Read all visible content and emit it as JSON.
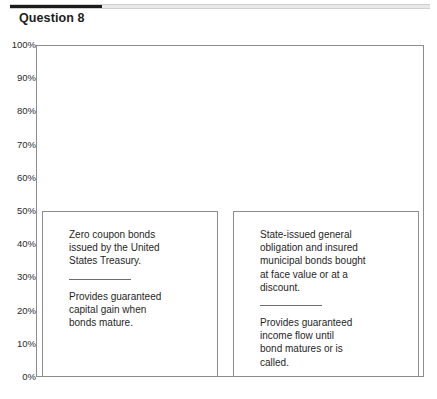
{
  "header": {
    "progress_percent": 22,
    "question_label": "Question 8"
  },
  "chart_data": {
    "type": "bar",
    "title": "",
    "xlabel": "",
    "ylabel": "",
    "ylim": [
      0,
      100
    ],
    "grid": false,
    "legend": null,
    "categories": [
      "",
      ""
    ],
    "values": [
      50,
      50
    ],
    "y_tick_labels": [
      "100%",
      "90%",
      "80%",
      "70%",
      "60%",
      "50%",
      "40%",
      "30%",
      "20%",
      "10%",
      "0%"
    ],
    "y_ticks": [
      100,
      90,
      80,
      70,
      60,
      50,
      40,
      30,
      20,
      10,
      0
    ],
    "bars": [
      {
        "value": 50,
        "primary_text": "Zero coupon bonds\nissued by the United\nStates Treasury.",
        "secondary_text": "Provides guaranteed\ncapital gain when\nbonds mature."
      },
      {
        "value": 50,
        "primary_text": "State-issued general\nobligation and insured\nmunicipal bonds bought\nat face value or at a\ndiscount.",
        "secondary_text": "Provides guaranteed\nincome flow until\nbond matures or is\ncalled."
      }
    ]
  },
  "colors": {
    "progress_fill": "#1b1b1b",
    "progress_track": "#e8e8e8",
    "axis_line": "#8d8d8d",
    "bar_fill": "#ffffff",
    "bar_border": "#8d8d8d",
    "text": "#1f1f1f"
  }
}
